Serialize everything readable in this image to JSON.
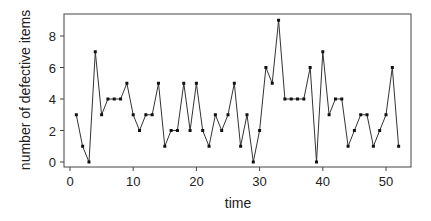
{
  "chart_data": {
    "type": "line",
    "title": "",
    "xlabel": "time",
    "ylabel": "number of defective items",
    "xlim": [
      -1.0,
      54.0
    ],
    "ylim": [
      -0.3,
      9.3
    ],
    "xticks": [
      0,
      10,
      20,
      30,
      40,
      50
    ],
    "yticks": [
      0,
      2,
      4,
      6,
      8
    ],
    "grid": false,
    "legend": null,
    "x": [
      1,
      2,
      3,
      4,
      5,
      6,
      7,
      8,
      9,
      10,
      11,
      12,
      13,
      14,
      15,
      16,
      17,
      18,
      19,
      20,
      21,
      22,
      23,
      24,
      25,
      26,
      27,
      28,
      29,
      30,
      31,
      32,
      33,
      34,
      35,
      36,
      37,
      38,
      39,
      40,
      41,
      42,
      43,
      44,
      45,
      46,
      47,
      48,
      49,
      50,
      51,
      52
    ],
    "series": [
      {
        "name": "defective items",
        "values": [
          3,
          1,
          0,
          7,
          3,
          4,
          4,
          4,
          5,
          3,
          2,
          3,
          3,
          5,
          1,
          2,
          2,
          5,
          2,
          5,
          2,
          1,
          3,
          2,
          3,
          5,
          1,
          3,
          0,
          2,
          6,
          5,
          9,
          4,
          4,
          4,
          4,
          6,
          0,
          7,
          3,
          4,
          4,
          1,
          2,
          3,
          3,
          1,
          2,
          3,
          6,
          1
        ]
      }
    ]
  },
  "colors": {
    "line": "#333333",
    "marker": "#111111",
    "axis": "#444444"
  }
}
